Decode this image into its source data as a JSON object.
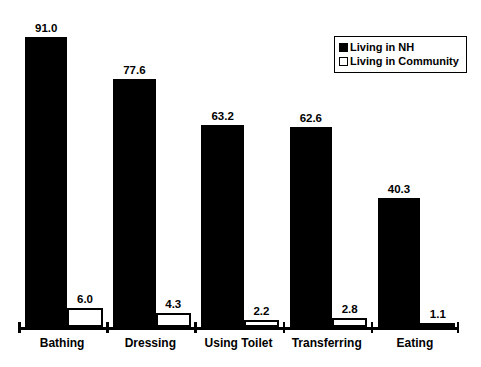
{
  "chart_data": {
    "type": "bar",
    "title": "",
    "subtitle": "",
    "xlabel": "",
    "ylabel": "",
    "ylim": [
      0,
      100
    ],
    "grid": false,
    "legend_position": "top-right",
    "categories": [
      "Bathing",
      "Dressing",
      "Using Toilet",
      "Transferring",
      "Eating"
    ],
    "series": [
      {
        "name": "Living in NH",
        "style": "filled-black",
        "color": "#000000",
        "values": [
          91.0,
          77.6,
          63.2,
          62.6,
          40.3
        ],
        "labels": [
          "91.0",
          "77.6",
          "63.2",
          "62.6",
          "40.3"
        ]
      },
      {
        "name": "Living in Community",
        "style": "hollow-white",
        "color": "#FFFFFF",
        "values": [
          6.0,
          4.3,
          2.2,
          2.8,
          1.1
        ],
        "labels": [
          "6.0",
          "4.3",
          "2.2",
          "2.8",
          "1.1"
        ]
      }
    ]
  },
  "legend": {
    "items": [
      {
        "label": "Living in NH",
        "swatch": "filled-square-black"
      },
      {
        "label": "Living in Community",
        "swatch": "hollow-square-white"
      }
    ]
  },
  "axis": {
    "line_color": "#000000",
    "tick_count": 6
  }
}
